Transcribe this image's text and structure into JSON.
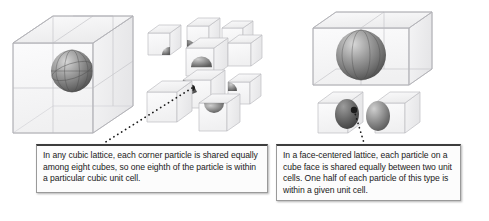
{
  "figure": {
    "background_color": "#ffffff"
  },
  "panels": {
    "left": {
      "name": "corner-particle-panel",
      "assembled_label": "2x2x2 block of eight cubes sharing one corner particle",
      "exploded_label": "Eight separated cubes each containing one eighth of the particle",
      "cube_count": 8,
      "fraction": "one eighth"
    },
    "right": {
      "name": "face-centered-particle-panel",
      "assembled_label": "Two adjacent cubes sharing one face-centered particle",
      "exploded_label": "Two separated cubes each containing one half of the particle",
      "cube_count": 2,
      "fraction": "one half"
    }
  },
  "callouts": {
    "left": {
      "name": "corner-particle-callout",
      "text": "In any cubic lattice, each corner particle is shared equally among eight cubes, so one eighth of the particle is within a particular cubic unit cell."
    },
    "right": {
      "name": "face-centered-particle-callout",
      "text": "In a face-centered lattice, each particle on a cube face is shared equally between two unit cells. One half of each particle of this type is within a given unit cell."
    }
  },
  "colors": {
    "cube_edge": "#b9b9bd",
    "cube_face": "#f2f2f3",
    "sphere_dark": "#5d5d5d",
    "sphere_mid": "#8e8e8e",
    "sphere_light": "#d0d0d0",
    "callout_border": "#9a9a9a",
    "callout_top_rule": "#3d3d3d",
    "callout_background": "#fcfcfc",
    "leader_line": "#1a1a1a",
    "text": "#1a1a1a"
  },
  "leader_lines": {
    "left": {
      "name": "left-leader-line",
      "from_x": 192,
      "from_y": 88,
      "to_x": 104,
      "to_y": 143,
      "style": "dotted"
    },
    "right": {
      "name": "right-leader-line",
      "from_x": 354,
      "from_y": 110,
      "to_x": 364,
      "to_y": 143,
      "style": "dotted"
    }
  }
}
